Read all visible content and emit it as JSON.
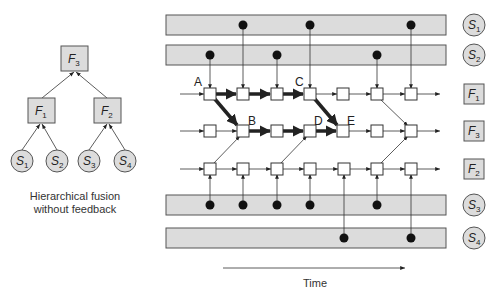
{
  "left_tree": {
    "caption_line1": "Hierarchical fusion",
    "caption_line2": "without feedback",
    "root": {
      "sym": "F",
      "sub": "3"
    },
    "mid": [
      {
        "sym": "F",
        "sub": "1"
      },
      {
        "sym": "F",
        "sub": "2"
      }
    ],
    "leaves": [
      {
        "sym": "S",
        "sub": "1"
      },
      {
        "sym": "S",
        "sub": "2"
      },
      {
        "sym": "S",
        "sub": "3"
      },
      {
        "sym": "S",
        "sub": "4"
      }
    ]
  },
  "right_diagram": {
    "point_labels": [
      "A",
      "B",
      "C",
      "D",
      "E"
    ],
    "rows": [
      {
        "id": "S1",
        "kind": "sensor",
        "sym": "S",
        "sub": "1"
      },
      {
        "id": "S2",
        "kind": "sensor",
        "sym": "S",
        "sub": "2"
      },
      {
        "id": "F1",
        "kind": "fusion",
        "sym": "F",
        "sub": "1"
      },
      {
        "id": "F3",
        "kind": "fusion",
        "sym": "F",
        "sub": "3"
      },
      {
        "id": "F2",
        "kind": "fusion",
        "sym": "F",
        "sub": "2"
      },
      {
        "id": "S3",
        "kind": "sensor",
        "sym": "S",
        "sub": "3"
      },
      {
        "id": "S4",
        "kind": "sensor",
        "sym": "S",
        "sub": "4"
      }
    ],
    "time_label": "Time"
  },
  "colors": {
    "band_fill": "#dcdcdc",
    "stroke": "#555555",
    "dot": "#111111",
    "node_fill": "#ffffff"
  }
}
